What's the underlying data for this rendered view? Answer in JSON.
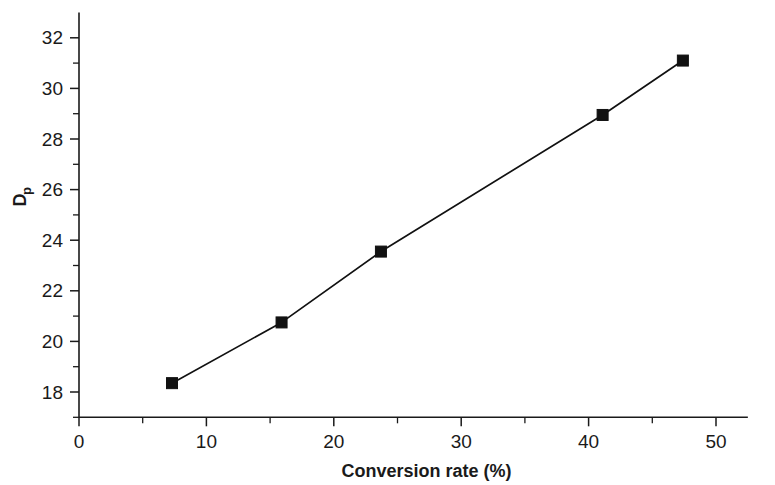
{
  "chart_data": {
    "type": "line",
    "title": "",
    "subtitle": "",
    "xlabel": "Conversion rate (%)",
    "ylabel": "Dp",
    "ylabel_base": "D",
    "ylabel_subscript": "p",
    "xlim": [
      0,
      52.5
    ],
    "ylim": [
      17,
      33
    ],
    "xticks": [
      0,
      10,
      20,
      30,
      40,
      50
    ],
    "xtick_labels": [
      "0",
      "10",
      "20",
      "30",
      "40",
      "50"
    ],
    "xminorticks": [
      5,
      15,
      25,
      35,
      45
    ],
    "yticks": [
      18,
      20,
      22,
      24,
      26,
      28,
      30,
      32
    ],
    "ytick_labels": [
      "18",
      "20",
      "22",
      "24",
      "26",
      "28",
      "30",
      "32"
    ],
    "yminorticks": [
      17,
      19,
      21,
      23,
      25,
      27,
      29,
      31
    ],
    "grid": false,
    "legend": false,
    "legend_position": "none",
    "marker": "filled-square",
    "marker_color": "#111111",
    "line_color": "#111111",
    "x": [
      7.3,
      15.9,
      23.7,
      41.1,
      47.4
    ],
    "values": [
      18.35,
      20.75,
      23.55,
      28.95,
      31.1
    ],
    "points": [
      {
        "x": 7.3,
        "y": 18.35
      },
      {
        "x": 15.9,
        "y": 20.75
      },
      {
        "x": 23.7,
        "y": 23.55
      },
      {
        "x": 41.1,
        "y": 28.95
      },
      {
        "x": 47.4,
        "y": 31.1
      }
    ]
  }
}
